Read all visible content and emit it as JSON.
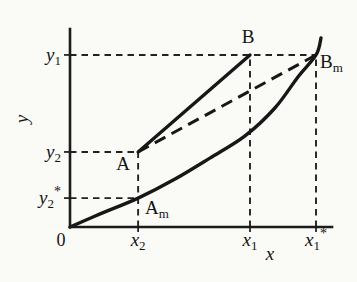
{
  "figure": {
    "background": "#fafaf7",
    "ink": "#171717"
  },
  "chart_data": {
    "type": "line",
    "title": "",
    "xlabel": "x",
    "ylabel": "y",
    "origin_label": "0",
    "xlim": [
      0,
      1
    ],
    "ylim": [
      0,
      1
    ],
    "x_ticks": [
      {
        "main": "x",
        "sub": "2",
        "sup": "",
        "value": 0.26
      },
      {
        "main": "x",
        "sub": "1",
        "sup": "",
        "value": 0.687
      },
      {
        "main": "x",
        "sub": "1",
        "sup": "*",
        "value": 0.939
      }
    ],
    "y_ticks": [
      {
        "main": "y",
        "sub": "1",
        "sup": "",
        "value": 0.869
      },
      {
        "main": "y",
        "sub": "2",
        "sup": "",
        "value": 0.379
      },
      {
        "main": "y",
        "sub": "2",
        "sup": "*",
        "value": 0.146
      }
    ],
    "points": [
      {
        "name": "A",
        "main": "A",
        "sub": "",
        "x": 0.26,
        "y": 0.379,
        "anchor": "middle",
        "dx": -15,
        "dy": 18
      },
      {
        "name": "B",
        "main": "B",
        "sub": "",
        "x": 0.687,
        "y": 0.869,
        "anchor": "middle",
        "dx": -2,
        "dy": -12
      },
      {
        "name": "Am",
        "main": "A",
        "sub": "m",
        "x": 0.26,
        "y": 0.146,
        "anchor": "start",
        "dx": 7,
        "dy": 16
      },
      {
        "name": "Bm",
        "main": "B",
        "sub": "m",
        "x": 0.939,
        "y": 0.869,
        "anchor": "start",
        "dx": 4,
        "dy": 13
      }
    ],
    "solid_segments": [
      {
        "name": "chord-A-B",
        "from": "A",
        "to": "B"
      }
    ],
    "dashed_segments": [
      {
        "name": "secant-A-Bm",
        "from": "A",
        "to": "Bm"
      }
    ],
    "curve": {
      "name": "lower-curve",
      "points": [
        [
          0,
          0
        ],
        [
          0.115,
          0.066
        ],
        [
          0.26,
          0.146
        ],
        [
          0.401,
          0.242
        ],
        [
          0.534,
          0.348
        ],
        [
          0.668,
          0.46
        ],
        [
          0.782,
          0.601
        ],
        [
          0.87,
          0.758
        ],
        [
          0.939,
          0.869
        ],
        [
          0.958,
          0.955
        ]
      ]
    },
    "guides": {
      "horizontal": [
        {
          "y": 0.869,
          "x_to": 0.939
        },
        {
          "y": 0.379,
          "x_to": 0.26
        },
        {
          "y": 0.146,
          "x_to": 0.26
        }
      ],
      "vertical": [
        {
          "x": 0.26,
          "y_to": 0.379
        },
        {
          "x": 0.687,
          "y_to": 0.869
        },
        {
          "x": 0.939,
          "y_to": 0.869
        }
      ]
    },
    "layout": {
      "canvas": [
        357,
        282
      ],
      "origin_px": [
        70,
        227
      ],
      "axis_end_x_px": 332,
      "axis_end_y_px": 29,
      "grid": false,
      "legend": false
    }
  }
}
